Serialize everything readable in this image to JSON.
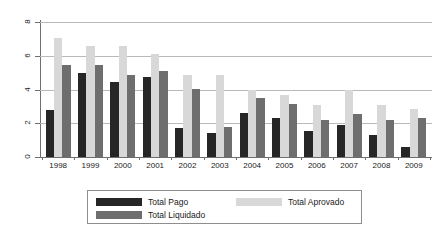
{
  "chart_data": {
    "type": "bar",
    "title": "",
    "subtitle": "",
    "xlabel": "",
    "ylabel": "",
    "ylim": [
      0,
      8
    ],
    "yticks": [
      0,
      2,
      4,
      6,
      8
    ],
    "ytick_labels": [
      "0",
      "2",
      "4",
      "6",
      "8"
    ],
    "grid": true,
    "grid_axis": "y",
    "legend_position": "bottom",
    "categories": [
      "1998",
      "1999",
      "2000",
      "2001",
      "2002",
      "2003",
      "2004",
      "2005",
      "2006",
      "2007",
      "2008",
      "2009"
    ],
    "series": [
      {
        "name": "Total Pago",
        "color": "#262626",
        "values": [
          2.78,
          5.0,
          4.45,
          4.75,
          1.72,
          1.45,
          2.62,
          2.32,
          1.52,
          1.88,
          1.28,
          0.62
        ]
      },
      {
        "name": "Total Aprovado",
        "color": "#d8d8d8",
        "values": [
          7.05,
          6.58,
          6.58,
          6.1,
          4.85,
          4.85,
          3.95,
          3.65,
          3.1,
          3.95,
          3.1,
          2.85
        ]
      },
      {
        "name": "Total Liquidado",
        "color": "#6e6e6e",
        "values": [
          5.45,
          5.45,
          4.85,
          5.1,
          4.05,
          1.78,
          3.5,
          3.15,
          2.22,
          2.52,
          2.18,
          2.32
        ]
      }
    ]
  },
  "legend": {
    "entries": [
      {
        "label": "Total Pago",
        "swatch": "pago"
      },
      {
        "label": "Total Liquidado",
        "swatch": "liquidado"
      },
      {
        "label": "Total Aprovado",
        "swatch": "aprovado"
      }
    ]
  },
  "colors": {
    "pago": "#262626",
    "aprovado": "#d8d8d8",
    "liquidado": "#6e6e6e",
    "grid": "#b9b9b9",
    "axis": "#6f6f6f",
    "background": "#ffffff"
  }
}
